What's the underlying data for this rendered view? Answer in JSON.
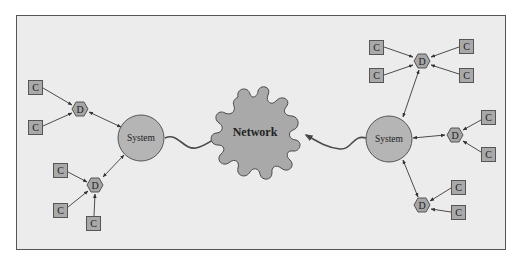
{
  "diagram": {
    "network": {
      "label": "Network"
    },
    "systems": [
      {
        "id": "left",
        "label": "System"
      },
      {
        "id": "right",
        "label": "System"
      }
    ],
    "devices": [
      {
        "id": "left-top",
        "label": "D",
        "system": "left",
        "clients": [
          "C",
          "C"
        ]
      },
      {
        "id": "left-bottom",
        "label": "D",
        "system": "left",
        "clients": [
          "C",
          "C",
          "C"
        ]
      },
      {
        "id": "right-top",
        "label": "D",
        "system": "right",
        "clients": [
          "C",
          "C",
          "C",
          "C"
        ]
      },
      {
        "id": "right-middle",
        "label": "D",
        "system": "right",
        "clients": [
          "C",
          "C"
        ]
      },
      {
        "id": "right-bottom",
        "label": "D",
        "system": "right",
        "clients": [
          "C",
          "C"
        ]
      }
    ],
    "colors": {
      "background": "#ececec",
      "node_fill": "#a9a9a9",
      "system_fill": "#b5b5b5",
      "stroke": "#555555"
    }
  }
}
